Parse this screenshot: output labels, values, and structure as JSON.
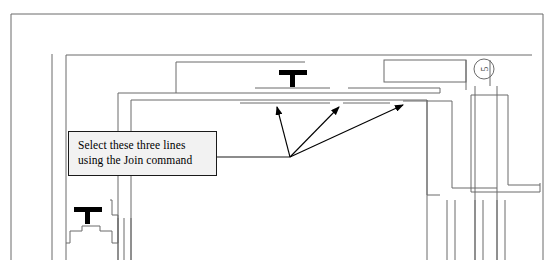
{
  "document": {
    "type": "architectural-floor-plan-excerpt",
    "title": "Floor plan with Join command annotation"
  },
  "annotation": {
    "callout": {
      "line1": "Select these three lines",
      "line2": "using the Join command",
      "fill_color": "#f2f2f2",
      "border_color": "#1a1a1a",
      "text_color": "#000000"
    },
    "leader": {
      "from_x": 217,
      "from_y": 157,
      "to_x": 290,
      "to_y": 157
    },
    "arrows": [
      {
        "name": "arrow-left",
        "x1": 290,
        "y1": 157,
        "x2": 277,
        "y2": 106
      },
      {
        "name": "arrow-center",
        "x1": 290,
        "y1": 157,
        "x2": 340,
        "y2": 106
      },
      {
        "name": "arrow-right",
        "x1": 290,
        "y1": 157,
        "x2": 404,
        "y2": 104
      }
    ]
  },
  "plan": {
    "line_color": "#6b6b6b",
    "line_color_dark": "#4a4a4a",
    "symbol_color": "#000000",
    "bubble": {
      "label": "5",
      "cx": 484,
      "cy": 69,
      "r": 10
    },
    "column_symbols": [
      {
        "name": "column-symbol-upper",
        "x": 293,
        "y": 72
      },
      {
        "name": "column-symbol-lower",
        "x": 88,
        "y": 210
      }
    ]
  }
}
